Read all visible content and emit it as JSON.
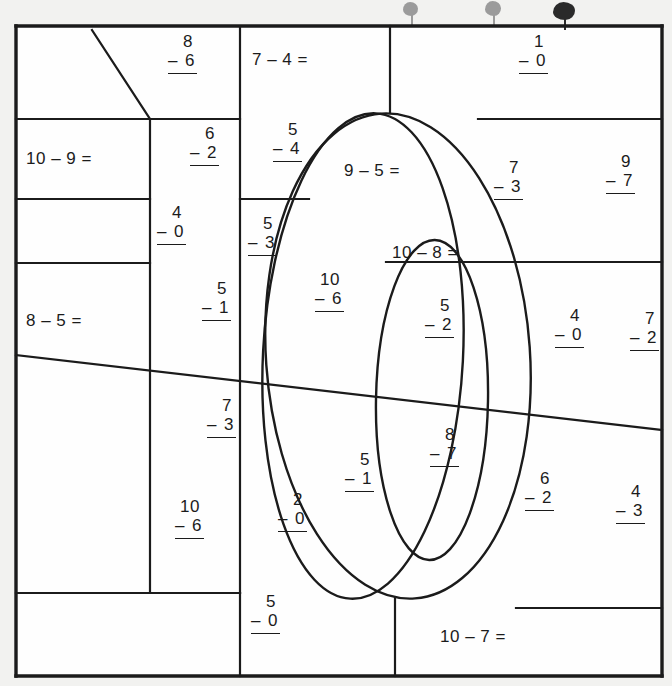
{
  "worksheet": {
    "title": "Subtraction color-by-number worksheet",
    "frame": {
      "x": 16,
      "y": 26,
      "w": 646,
      "h": 650
    },
    "ink_color": "#1b1b1b",
    "paper_color": "#fefefe",
    "background_color": "#f2f2f0"
  },
  "problems": [
    {
      "id": "p01",
      "kind": "stack",
      "top": "8",
      "op": "–",
      "bottom": "6",
      "x": 168,
      "y": 32
    },
    {
      "id": "p02",
      "kind": "inline",
      "text": "7 – 4 =",
      "x": 252,
      "y": 50
    },
    {
      "id": "p03",
      "kind": "stack",
      "top": "1",
      "op": "–",
      "bottom": "0",
      "x": 519,
      "y": 32
    },
    {
      "id": "p04",
      "kind": "inline",
      "text": "10 – 9 =",
      "x": 26,
      "y": 149
    },
    {
      "id": "p05",
      "kind": "stack",
      "top": "6",
      "op": "–",
      "bottom": "2",
      "x": 190,
      "y": 124
    },
    {
      "id": "p06",
      "kind": "stack",
      "top": "5",
      "op": "–",
      "bottom": "4",
      "x": 273,
      "y": 120
    },
    {
      "id": "p07",
      "kind": "inline",
      "text": "9 – 5 =",
      "x": 344,
      "y": 161
    },
    {
      "id": "p08",
      "kind": "stack",
      "top": "7",
      "op": "–",
      "bottom": "3",
      "x": 494,
      "y": 158
    },
    {
      "id": "p09",
      "kind": "stack",
      "top": "9",
      "op": "–",
      "bottom": "7",
      "x": 606,
      "y": 152
    },
    {
      "id": "p10",
      "kind": "stack",
      "top": "4",
      "op": "–",
      "bottom": "0",
      "x": 157,
      "y": 203
    },
    {
      "id": "p11",
      "kind": "stack",
      "top": "5",
      "op": "–",
      "bottom": "3",
      "x": 248,
      "y": 214
    },
    {
      "id": "p12",
      "kind": "inline",
      "text": "10 – 8 =",
      "x": 392,
      "y": 243
    },
    {
      "id": "p13",
      "kind": "stack",
      "top": "5",
      "op": "–",
      "bottom": "1",
      "x": 202,
      "y": 279
    },
    {
      "id": "p14",
      "kind": "stack",
      "top": "10",
      "op": "–",
      "bottom": "6",
      "x": 315,
      "y": 270
    },
    {
      "id": "p15",
      "kind": "stack",
      "top": "5",
      "op": "–",
      "bottom": "2",
      "x": 425,
      "y": 296
    },
    {
      "id": "p16",
      "kind": "stack",
      "top": "4",
      "op": "–",
      "bottom": "0",
      "x": 555,
      "y": 306
    },
    {
      "id": "p17",
      "kind": "stack",
      "top": "7",
      "op": "–",
      "bottom": "2",
      "x": 630,
      "y": 309
    },
    {
      "id": "p18",
      "kind": "inline",
      "text": "8 – 5 =",
      "x": 26,
      "y": 311
    },
    {
      "id": "p19",
      "kind": "stack",
      "top": "7",
      "op": "–",
      "bottom": "3",
      "x": 207,
      "y": 396
    },
    {
      "id": "p20",
      "kind": "stack",
      "top": "8",
      "op": "–",
      "bottom": "7",
      "x": 430,
      "y": 425
    },
    {
      "id": "p21",
      "kind": "stack",
      "top": "5",
      "op": "–",
      "bottom": "1",
      "x": 345,
      "y": 450
    },
    {
      "id": "p22",
      "kind": "stack",
      "top": "6",
      "op": "–",
      "bottom": "2",
      "x": 525,
      "y": 469
    },
    {
      "id": "p23",
      "kind": "stack",
      "top": "4",
      "op": "–",
      "bottom": "3",
      "x": 616,
      "y": 482
    },
    {
      "id": "p24",
      "kind": "stack",
      "top": "10",
      "op": "–",
      "bottom": "6",
      "x": 175,
      "y": 497
    },
    {
      "id": "p25",
      "kind": "stack",
      "top": "2",
      "op": "–",
      "bottom": "0",
      "x": 278,
      "y": 490
    },
    {
      "id": "p26",
      "kind": "stack",
      "top": "5",
      "op": "–",
      "bottom": "0",
      "x": 251,
      "y": 592
    },
    {
      "id": "p27",
      "kind": "inline",
      "text": "10 – 7 =",
      "x": 440,
      "y": 627
    }
  ],
  "geometry": {
    "description": "Color-by-number region map: straight dividing lines plus three nested ellipses forming a stylized numeral.",
    "lines": [
      {
        "name": "frame-top",
        "d": "M 16 26 L 662 26"
      },
      {
        "name": "frame-left",
        "d": "M 16 26 L 16 676"
      },
      {
        "name": "frame-right",
        "d": "M 662 26 L 662 676"
      },
      {
        "name": "frame-bottom",
        "d": "M 16 676 L 662 676"
      },
      {
        "name": "row-1-sep",
        "d": "M 16 119 L 240 119"
      },
      {
        "name": "row-2-sep",
        "d": "M 16 199 L 150 199"
      },
      {
        "name": "row-3-sep",
        "d": "M 16 263 L 150 263"
      },
      {
        "name": "diag-long",
        "d": "M 16 355 L 662 430"
      },
      {
        "name": "row-bottom-sep",
        "d": "M 16 593 L 240 593"
      },
      {
        "name": "vert-a",
        "d": "M 150 119 L 150 593"
      },
      {
        "name": "vert-b",
        "d": "M 240 26 L 240 593"
      },
      {
        "name": "vert-c",
        "d": "M 240 676 L 240 593"
      },
      {
        "name": "diag-corner",
        "d": "M 92 30 L 150 119"
      },
      {
        "name": "vert-d",
        "d": "M 390 26 L 390 113"
      },
      {
        "name": "vert-e",
        "d": "M 395 598 L 395 676"
      },
      {
        "name": "row-right-1",
        "d": "M 478 119 L 662 119"
      },
      {
        "name": "row-right-2",
        "d": "M 240 199 L 309 199"
      },
      {
        "name": "row-right-3",
        "d": "M 386 262 L 662 262"
      },
      {
        "name": "row-right-4",
        "d": "M 516 608 L 662 608"
      }
    ],
    "ellipses": [
      {
        "name": "outer-oval",
        "cx": 398,
        "cy": 356,
        "rx": 132,
        "ry": 243,
        "rotate": -4
      },
      {
        "name": "mid-oval",
        "cx": 363,
        "cy": 356,
        "rx": 100,
        "ry": 243,
        "rotate": 3
      },
      {
        "name": "inner-oval",
        "cx": 432,
        "cy": 400,
        "rx": 56,
        "ry": 160,
        "rotate": 1
      }
    ]
  },
  "artifacts": {
    "name": "scanner-ink-marks",
    "marks": [
      {
        "x": 403,
        "y": 2,
        "w": 15,
        "h": 14,
        "tone": "light"
      },
      {
        "x": 485,
        "y": 1,
        "w": 16,
        "h": 15,
        "tone": "light"
      },
      {
        "x": 553,
        "y": 2,
        "w": 22,
        "h": 18,
        "tone": "dark"
      }
    ]
  }
}
